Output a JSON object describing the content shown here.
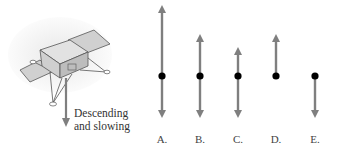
{
  "figure": {
    "caption_line1": "Descending",
    "caption_line2": "and slowing",
    "object": "lander",
    "motion_arrow_direction": "down"
  },
  "options": [
    {
      "label": "A.",
      "x": 162,
      "up_len": 71,
      "down_len": 42
    },
    {
      "label": "B.",
      "x": 200,
      "up_len": 42,
      "down_len": 42
    },
    {
      "label": "C.",
      "x": 238,
      "up_len": 29,
      "down_len": 42
    },
    {
      "label": "D.",
      "x": 276,
      "up_len": 42,
      "down_len": 0
    },
    {
      "label": "E.",
      "x": 315,
      "up_len": 0,
      "down_len": 42
    }
  ],
  "colors": {
    "arrow": "#7f7f7f",
    "dot": "#000000",
    "lander_fill": "#d9d9d9",
    "lander_stroke": "#555555"
  }
}
